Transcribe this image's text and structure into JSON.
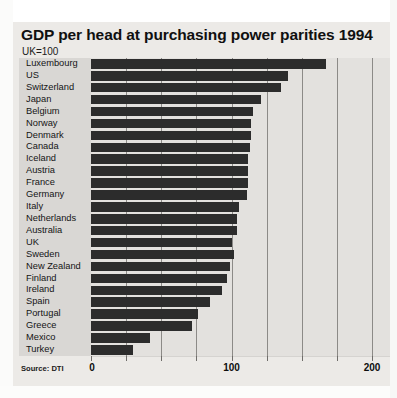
{
  "chart_data": {
    "type": "bar",
    "orientation": "horizontal",
    "title": "GDP per head at purchasing power parities 1994",
    "subtitle": "UK=100",
    "source": "Source: DTI",
    "xlabel": "",
    "ylabel": "",
    "xlim": [
      0,
      200
    ],
    "xticks": [
      0,
      25,
      50,
      75,
      100,
      125,
      150,
      175,
      200
    ],
    "xtick_labels_shown": [
      "0",
      "100",
      "200"
    ],
    "grid": true,
    "legend": null,
    "bar_color": "#2c2c2c",
    "panel_color": "#e3e1de",
    "label_color": "#d9d7d4",
    "categories": [
      "Luxembourg",
      "US",
      "Switzerland",
      "Japan",
      "Belgium",
      "Norway",
      "Denmark",
      "Canada",
      "Iceland",
      "Austria",
      "France",
      "Germany",
      "Italy",
      "Netherlands",
      "Australia",
      "UK",
      "Sweden",
      "New Zealand",
      "Finland",
      "Ireland",
      "Spain",
      "Portugal",
      "Greece",
      "Mexico",
      "Turkey"
    ],
    "values": [
      167,
      140,
      135,
      121,
      115,
      114,
      114,
      113,
      112,
      112,
      112,
      111,
      105,
      104,
      104,
      100,
      102,
      99,
      97,
      93,
      85,
      76,
      72,
      42,
      30
    ]
  }
}
